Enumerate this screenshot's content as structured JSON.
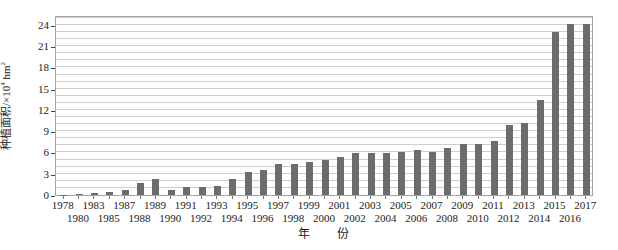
{
  "chart_data": {
    "type": "bar",
    "title": "",
    "xlabel": "年　　份",
    "ylabel": "种植面积/×10⁴ hm²",
    "ylabel_rich": [
      {
        "t": "种植面积/×10",
        "sup": false
      },
      {
        "t": "4",
        "sup": true
      },
      {
        "t": " hm",
        "sup": false
      },
      {
        "t": "2",
        "sup": true
      }
    ],
    "categories": [
      1978,
      1980,
      1983,
      1985,
      1987,
      1988,
      1989,
      1990,
      1991,
      1992,
      1993,
      1994,
      1995,
      1996,
      1997,
      1998,
      1999,
      2000,
      2001,
      2002,
      2003,
      2004,
      2005,
      2006,
      2007,
      2008,
      2009,
      2010,
      2011,
      2012,
      2013,
      2014,
      2015,
      2016,
      2017
    ],
    "values": [
      0.05,
      0.08,
      0.3,
      0.45,
      0.7,
      1.7,
      2.2,
      0.75,
      1.2,
      1.1,
      1.3,
      2.2,
      3.2,
      3.5,
      4.4,
      4.4,
      4.7,
      5.0,
      5.3,
      5.9,
      5.9,
      5.9,
      6.0,
      6.3,
      6.1,
      6.6,
      7.2,
      7.2,
      7.6,
      9.9,
      10.2,
      13.4,
      23.0,
      24.1,
      24.1
    ],
    "yticks": [
      0,
      3,
      6,
      9,
      12,
      15,
      18,
      21,
      24
    ],
    "ylim": [
      0,
      25.4
    ],
    "grid_step": 1,
    "legend": null,
    "layout": {
      "plot_left": 55,
      "plot_top": 16,
      "plot_width": 538,
      "plot_height": 180,
      "bar_width": 7,
      "xtick_rows": "staggered"
    },
    "colors": {
      "bar": "#6c6c6c",
      "grid": "#cecece",
      "frame": "#a3a3a3",
      "text": "#1c1c1c",
      "background": "#ffffff"
    }
  }
}
